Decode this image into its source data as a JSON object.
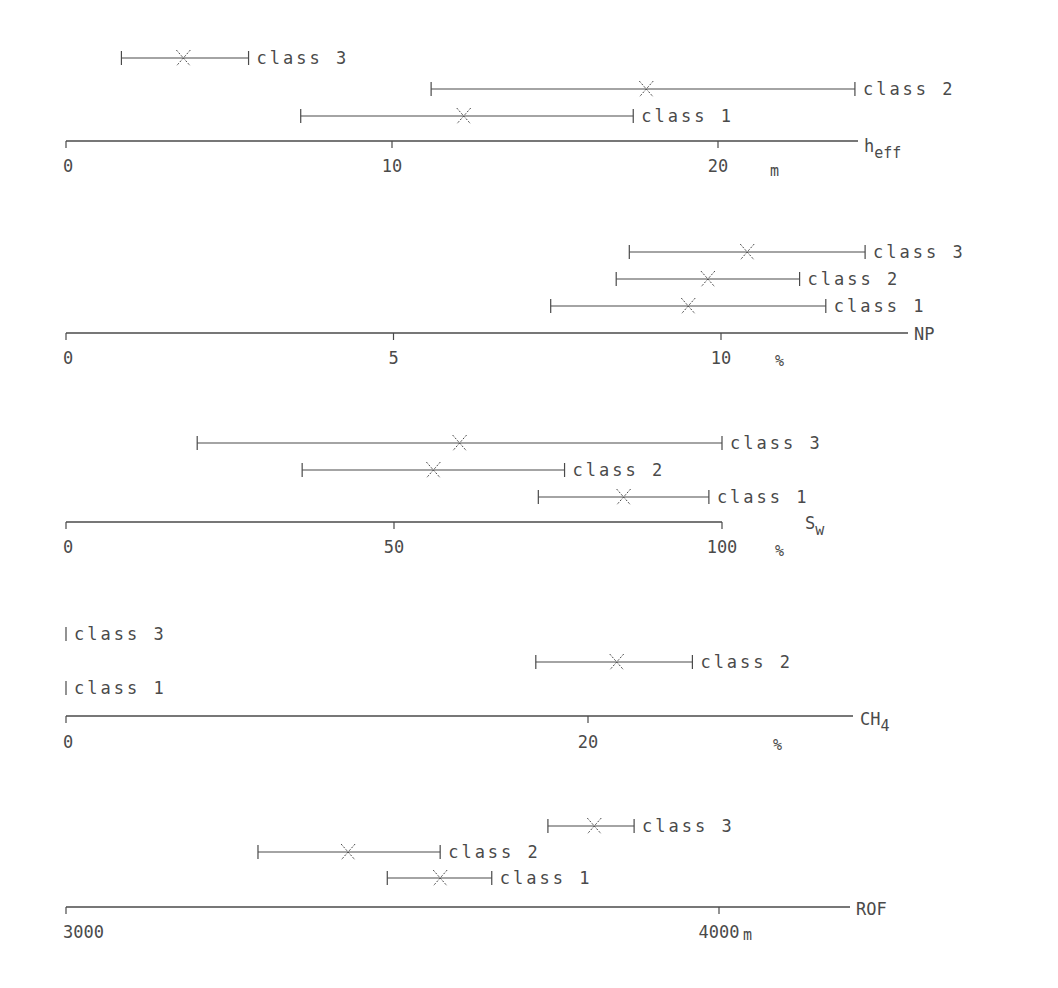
{
  "chart_data": [
    {
      "type": "range",
      "variable": "h_eff",
      "axis_label": "h",
      "axis_label_sub": "eff",
      "unit": "m",
      "xlim": [
        0,
        24.3
      ],
      "ticks": [
        0,
        10,
        20
      ],
      "tick_labels": [
        "0",
        "10",
        "20"
      ],
      "series": [
        {
          "name": "class 3",
          "min": 1.7,
          "mean": 3.6,
          "max": 5.6
        },
        {
          "name": "class 2",
          "min": 11.2,
          "mean": 17.8,
          "max": 24.2
        },
        {
          "name": "class 1",
          "min": 7.2,
          "mean": 12.2,
          "max": 17.4
        }
      ]
    },
    {
      "type": "range",
      "variable": "NP",
      "axis_label": "NP",
      "axis_label_sub": "",
      "unit": "%",
      "xlim": [
        0,
        12.8
      ],
      "ticks": [
        0,
        5,
        10
      ],
      "tick_labels": [
        "0",
        "5",
        "10"
      ],
      "series": [
        {
          "name": "class 3",
          "min": 8.6,
          "mean": 10.4,
          "max": 12.2
        },
        {
          "name": "class 2",
          "min": 8.4,
          "mean": 9.8,
          "max": 11.2
        },
        {
          "name": "class 1",
          "min": 7.4,
          "mean": 9.5,
          "max": 11.6
        }
      ]
    },
    {
      "type": "range",
      "variable": "S_w",
      "axis_label": "S",
      "axis_label_sub": "w",
      "unit": "%",
      "xlim": [
        0,
        100
      ],
      "ticks": [
        0,
        50,
        100
      ],
      "tick_labels": [
        "0",
        "50",
        "100"
      ],
      "series": [
        {
          "name": "class 3",
          "min": 20,
          "mean": 60,
          "max": 100
        },
        {
          "name": "class 2",
          "min": 36,
          "mean": 56,
          "max": 76
        },
        {
          "name": "class 1",
          "min": 72,
          "mean": 85,
          "max": 98
        }
      ]
    },
    {
      "type": "range",
      "variable": "CH4",
      "axis_label": "CH",
      "axis_label_sub": "4",
      "unit": "%",
      "xlim": [
        0,
        30
      ],
      "ticks": [
        0,
        20
      ],
      "tick_labels": [
        "0",
        "20"
      ],
      "series": [
        {
          "name": "class 3",
          "min": 0,
          "mean": 0,
          "max": 0
        },
        {
          "name": "class 2",
          "min": 18.0,
          "mean": 21.1,
          "max": 24.0
        },
        {
          "name": "class 1",
          "min": 0,
          "mean": 0,
          "max": 0
        }
      ]
    },
    {
      "type": "range",
      "variable": "ROF",
      "axis_label": "ROF",
      "axis_label_sub": "",
      "unit": "m",
      "xlim": [
        3000,
        4210
      ],
      "ticks": [
        3000,
        4000
      ],
      "tick_labels": [
        "3000",
        "4000"
      ],
      "series": [
        {
          "name": "class 3",
          "min": 3738,
          "mean": 3809,
          "max": 3870
        },
        {
          "name": "class 2",
          "min": 3294,
          "mean": 3432,
          "max": 3573
        },
        {
          "name": "class 1",
          "min": 3492,
          "mean": 3573,
          "max": 3652
        }
      ]
    }
  ],
  "layout": {
    "panels": [
      {
        "axis_y": 141,
        "x0": 66,
        "px_per_unit": 32.6,
        "axis_end": 858,
        "unit_x": 770,
        "tick_label_y": 172,
        "unit_y": 176,
        "label_x": 864,
        "label_y": 152,
        "row_y": [
          58,
          89,
          116
        ],
        "label_offsets": [
          0,
          0,
          0
        ]
      },
      {
        "axis_y": 333,
        "x0": 66,
        "px_per_unit": 65.5,
        "axis_end": 908,
        "unit_x": 775,
        "tick_label_y": 364,
        "unit_y": 366,
        "label_x": 914,
        "label_y": 340,
        "row_y": [
          252,
          279,
          306
        ]
      },
      {
        "axis_y": 522,
        "x0": 66,
        "px_per_unit": 6.56,
        "axis_end": 722,
        "unit_x": 775,
        "tick_label_y": 553,
        "unit_y": 556,
        "label_x": 805,
        "label_y": 529,
        "row_y": [
          443,
          470,
          497
        ]
      },
      {
        "axis_y": 716,
        "x0": 66,
        "px_per_unit": 26.1,
        "axis_end": 853,
        "unit_x": 773,
        "tick_label_y": 748,
        "unit_y": 750,
        "label_x": 860,
        "label_y": 725,
        "row_y": [
          634,
          662,
          688
        ]
      },
      {
        "axis_y": 907,
        "x0": 66,
        "px_per_unit": 0.653,
        "axis_end": 850,
        "unit_x": 743,
        "tick_label_y": 938,
        "unit_y": 940,
        "label_x": 856,
        "label_y": 915,
        "row_y": [
          826,
          852,
          878
        ]
      }
    ],
    "line_color": "#4a4a4a"
  }
}
